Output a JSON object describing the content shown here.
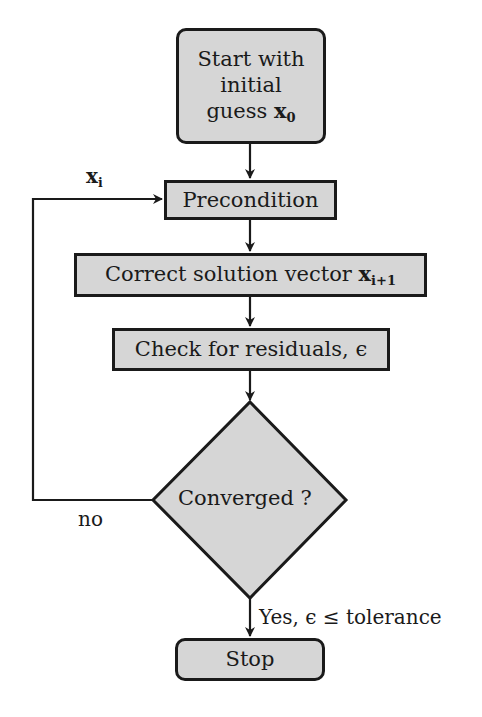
{
  "diagram": {
    "type": "flowchart",
    "nodes": {
      "start": {
        "line1": "Start with",
        "line2": "initial",
        "line3_text": "guess ",
        "line3_var": "x",
        "line3_sub": "0"
      },
      "precondition": {
        "label": "Precondition"
      },
      "correct": {
        "text": "Correct solution vector ",
        "var": "x",
        "sub": "i+1"
      },
      "check": {
        "label": "Check for residuals, ϵ"
      },
      "decision": {
        "label": "Converged ?"
      },
      "stop": {
        "label": "Stop"
      }
    },
    "edges": {
      "loop_var": "x",
      "loop_sub": "i",
      "no_label": "no",
      "yes_label": "Yes, ϵ ≤ tolerance"
    },
    "colors": {
      "fill": "#d6d6d6",
      "stroke": "#1a1a1a"
    }
  }
}
